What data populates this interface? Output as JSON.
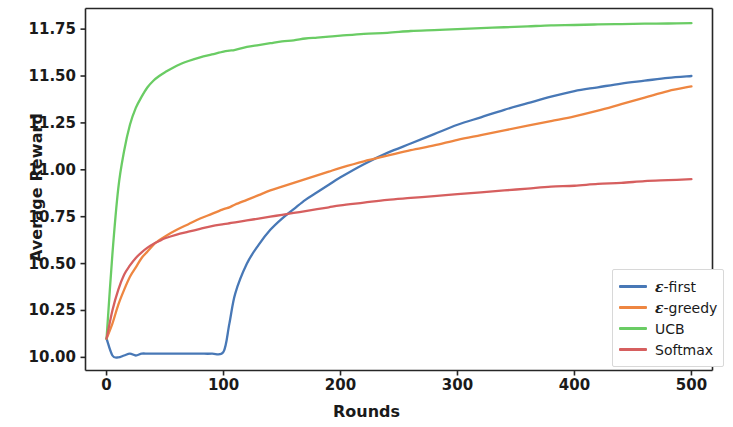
{
  "chart_data": {
    "type": "line",
    "title": "",
    "xlabel": "Rounds",
    "ylabel": "Average Reward",
    "xlim": [
      -18,
      518
    ],
    "ylim": [
      9.93,
      11.86
    ],
    "xticks": [
      0,
      100,
      200,
      300,
      400,
      500
    ],
    "xtick_labels": [
      "0",
      "100",
      "200",
      "300",
      "400",
      "500"
    ],
    "yticks": [
      10.0,
      10.25,
      10.5,
      10.75,
      11.0,
      11.25,
      11.5,
      11.75
    ],
    "ytick_labels": [
      "10.00",
      "10.25",
      "10.50",
      "10.75",
      "11.00",
      "11.25",
      "11.50",
      "11.75"
    ],
    "grid": false,
    "legend_position": "lower right",
    "x": [
      0,
      5,
      10,
      15,
      20,
      25,
      30,
      35,
      40,
      45,
      50,
      60,
      70,
      80,
      90,
      100,
      105,
      110,
      120,
      130,
      140,
      150,
      160,
      170,
      180,
      190,
      200,
      220,
      240,
      260,
      280,
      300,
      320,
      340,
      360,
      380,
      400,
      420,
      440,
      460,
      480,
      500
    ],
    "series": [
      {
        "name": "ε-first",
        "color": "#4878b6",
        "values": [
          10.1,
          10.01,
          10.0,
          10.01,
          10.02,
          10.01,
          10.02,
          10.02,
          10.02,
          10.02,
          10.02,
          10.02,
          10.02,
          10.02,
          10.02,
          10.03,
          10.18,
          10.34,
          10.5,
          10.6,
          10.68,
          10.74,
          10.79,
          10.84,
          10.88,
          10.92,
          10.96,
          11.03,
          11.09,
          11.14,
          11.19,
          11.24,
          11.28,
          11.32,
          11.355,
          11.39,
          11.42,
          11.44,
          11.46,
          11.475,
          11.49,
          11.5
        ]
      },
      {
        "name": "ε-greedy",
        "color": "#ee8641",
        "values": [
          10.1,
          10.18,
          10.28,
          10.36,
          10.43,
          10.48,
          10.53,
          10.565,
          10.6,
          10.625,
          10.645,
          10.68,
          10.71,
          10.74,
          10.765,
          10.79,
          10.8,
          10.815,
          10.84,
          10.865,
          10.89,
          10.91,
          10.93,
          10.95,
          10.97,
          10.99,
          11.01,
          11.045,
          11.075,
          11.105,
          11.13,
          11.16,
          11.185,
          11.21,
          11.235,
          11.26,
          11.285,
          11.315,
          11.35,
          11.385,
          11.42,
          11.445
        ]
      },
      {
        "name": "UCB",
        "color": "#6acc64",
        "values": [
          10.1,
          10.55,
          10.9,
          11.1,
          11.24,
          11.33,
          11.39,
          11.44,
          11.475,
          11.5,
          11.52,
          11.555,
          11.58,
          11.6,
          11.615,
          11.63,
          11.635,
          11.64,
          11.655,
          11.665,
          11.675,
          11.685,
          11.69,
          11.7,
          11.705,
          11.71,
          11.715,
          11.725,
          11.73,
          11.74,
          11.745,
          11.75,
          11.755,
          11.76,
          11.765,
          11.77,
          11.772,
          11.775,
          11.777,
          11.779,
          11.78,
          11.782
        ]
      },
      {
        "name": "Softmax",
        "color": "#d65f5f",
        "values": [
          10.1,
          10.25,
          10.36,
          10.44,
          10.49,
          10.53,
          10.56,
          10.585,
          10.605,
          10.62,
          10.635,
          10.655,
          10.67,
          10.685,
          10.7,
          10.71,
          10.715,
          10.72,
          10.73,
          10.74,
          10.75,
          10.76,
          10.77,
          10.78,
          10.79,
          10.8,
          10.81,
          10.825,
          10.84,
          10.85,
          10.86,
          10.87,
          10.88,
          10.89,
          10.9,
          10.91,
          10.915,
          10.925,
          10.93,
          10.94,
          10.945,
          10.95
        ]
      }
    ],
    "legend": [
      {
        "label_html": "ε-first",
        "color": "#4878b6"
      },
      {
        "label_html": "ε-greedy",
        "color": "#ee8641"
      },
      {
        "label_html": "UCB",
        "color": "#6acc64"
      },
      {
        "label_html": "Softmax",
        "color": "#d65f5f"
      }
    ]
  }
}
